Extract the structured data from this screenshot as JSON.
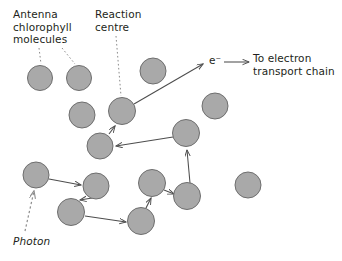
{
  "diagram": {
    "title_labels": {
      "antenna": "Antenna\nchlorophyll\nmolecules",
      "reaction_centre": "Reaction\ncentre",
      "electron": "e⁻",
      "electron_transport": "To electron\ntransport chain",
      "photon": "Photon"
    },
    "colors": {
      "molecule_fill": "#a9a9a9",
      "molecule_stroke": "#6e6e6e",
      "arrow": "#4d4d4d",
      "leader_dotted": "#8c8c8c",
      "text": "#231f20",
      "background": "#ffffff"
    },
    "molecules": [
      {
        "id": "m1",
        "name": "antenna-molecule-1",
        "cx": 40,
        "cy": 78,
        "r": 12.5
      },
      {
        "id": "m2",
        "name": "antenna-molecule-2",
        "cx": 79,
        "cy": 78,
        "r": 12.5
      },
      {
        "id": "m3",
        "name": "antenna-molecule-3",
        "cx": 153,
        "cy": 71,
        "r": 13
      },
      {
        "id": "m4",
        "name": "antenna-molecule-4",
        "cx": 82,
        "cy": 115,
        "r": 13
      },
      {
        "id": "m5",
        "name": "reaction-centre-molecule",
        "cx": 122,
        "cy": 111,
        "r": 13.5
      },
      {
        "id": "m6",
        "name": "antenna-molecule-6",
        "cx": 215,
        "cy": 106,
        "r": 13
      },
      {
        "id": "m7",
        "name": "antenna-molecule-7",
        "cx": 100,
        "cy": 146,
        "r": 13
      },
      {
        "id": "m8",
        "name": "antenna-molecule-8",
        "cx": 186,
        "cy": 133,
        "r": 13.5
      },
      {
        "id": "m9",
        "name": "antenna-molecule-9",
        "cx": 36,
        "cy": 175,
        "r": 13
      },
      {
        "id": "m10",
        "name": "antenna-molecule-10",
        "cx": 96,
        "cy": 186,
        "r": 13
      },
      {
        "id": "m11",
        "name": "antenna-molecule-11",
        "cx": 71,
        "cy": 212,
        "r": 13.5
      },
      {
        "id": "m12",
        "name": "antenna-molecule-12",
        "cx": 152,
        "cy": 183,
        "r": 13.5
      },
      {
        "id": "m13",
        "name": "antenna-molecule-13",
        "cx": 187,
        "cy": 196,
        "r": 13.5
      },
      {
        "id": "m14",
        "name": "antenna-molecule-14",
        "cx": 141,
        "cy": 221,
        "r": 13.5
      },
      {
        "id": "m15",
        "name": "antenna-molecule-15",
        "cx": 248,
        "cy": 185,
        "r": 13
      }
    ],
    "energy_transfer_arrows": [
      {
        "name": "arrow-photon-to-m9",
        "from": "photon-source",
        "to": "m9",
        "style": "dotted"
      },
      {
        "name": "arrow-m9-to-m10",
        "from": "m9",
        "to": "m10",
        "style": "solid"
      },
      {
        "name": "arrow-m10-to-m11",
        "from": "m10",
        "to": "m11",
        "style": "solid"
      },
      {
        "name": "arrow-m11-to-m14",
        "from": "m11",
        "to": "m14",
        "style": "solid"
      },
      {
        "name": "arrow-m14-to-m12",
        "from": "m14",
        "to": "m12",
        "style": "solid"
      },
      {
        "name": "arrow-m12-to-m13",
        "from": "m12",
        "to": "m13",
        "style": "solid"
      },
      {
        "name": "arrow-m13-to-m8",
        "from": "m13",
        "to": "m8",
        "style": "solid"
      },
      {
        "name": "arrow-m8-to-m7",
        "from": "m8",
        "to": "m7",
        "style": "solid"
      },
      {
        "name": "arrow-m7-to-m5",
        "from": "m7",
        "to": "m5",
        "style": "solid"
      },
      {
        "name": "arrow-m5-to-electron",
        "from": "m5",
        "to": "e-minus",
        "style": "solid"
      },
      {
        "name": "arrow-electron-to-chain",
        "from": "e-minus",
        "to": "electron-transport-chain",
        "style": "solid"
      }
    ],
    "leader_lines": [
      {
        "name": "leader-antenna-to-m1",
        "from_label": "antenna",
        "to_molecule": "m1"
      },
      {
        "name": "leader-antenna-to-m2",
        "from_label": "antenna",
        "to_molecule": "m2"
      },
      {
        "name": "leader-reaction-to-m5",
        "from_label": "reaction_centre",
        "to_molecule": "m5"
      }
    ]
  }
}
